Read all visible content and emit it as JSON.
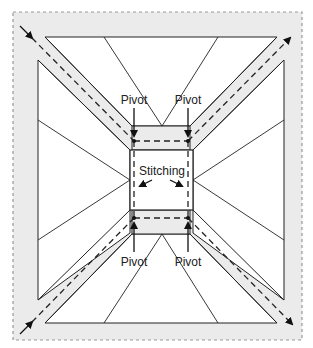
{
  "diagram": {
    "labels": {
      "pivot_top_left": "Pivot",
      "pivot_top_right": "Pivot",
      "pivot_bottom_left": "Pivot",
      "pivot_bottom_right": "Pivot",
      "stitching": "Stitching"
    },
    "colors": {
      "background": "#ffffff",
      "seam_fill": "#ebebeb",
      "line": "#222222",
      "outer_border": "#999999"
    }
  }
}
